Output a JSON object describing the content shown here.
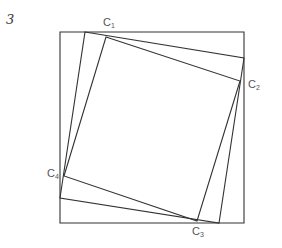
{
  "figure": {
    "number": "3",
    "labels": {
      "c1": {
        "base": "C",
        "sub": "1"
      },
      "c2": {
        "base": "C",
        "sub": "2"
      },
      "c3": {
        "base": "C",
        "sub": "3"
      },
      "c4": {
        "base": "C",
        "sub": "4"
      }
    },
    "stroke_color": "#333333",
    "label_color": "#555555"
  }
}
